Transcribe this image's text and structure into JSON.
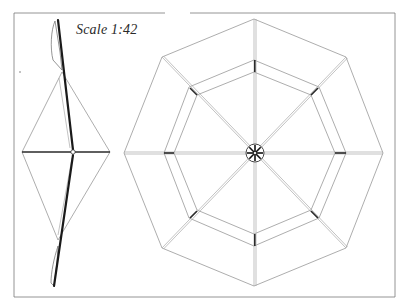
{
  "title": "Scale 1:42",
  "drawing": {
    "type": "technical-drawing",
    "views": [
      {
        "name": "side-view",
        "description": "Side elevation of rotor: central mast with upper and lower blade profiles and diamond-shaped stays"
      },
      {
        "name": "plan-view",
        "description": "Plan view: octagonal outer rim, inner octagonal ring, eight spokes radiating from a central hub"
      }
    ],
    "scale": "1:42",
    "colors": {
      "line": "#8a8a8a",
      "heavy_line": "#1a1a1a",
      "background": "#ffffff"
    }
  }
}
